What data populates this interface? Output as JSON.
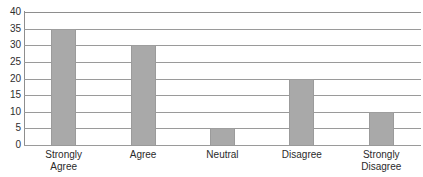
{
  "chart_data": {
    "type": "bar",
    "title": "",
    "title_visible": false,
    "title_note": "chart title is cropped off the top edge of the image and is illegible",
    "xlabel": "",
    "ylabel": "",
    "categories": [
      "Strongly Agree",
      "Agree",
      "Neutral",
      "Disagree",
      "Strongly Disagree"
    ],
    "category_lines": [
      [
        "Strongly",
        "Agree"
      ],
      [
        "Agree",
        ""
      ],
      [
        "Neutral",
        ""
      ],
      [
        "Disagree",
        ""
      ],
      [
        "Strongly",
        "Disagree"
      ]
    ],
    "values": [
      35,
      30,
      5,
      20,
      10
    ],
    "ylim": [
      0,
      40
    ],
    "ytick_step": 5,
    "yticks": [
      40,
      35,
      30,
      25,
      20,
      15,
      10,
      5,
      0
    ],
    "ytick_labels": [
      "40",
      "35",
      "30",
      "25",
      "20",
      "15",
      "10",
      "5",
      "0"
    ],
    "grid": true,
    "grid_orientation": "horizontal",
    "legend": false,
    "legend_position": "none",
    "bar_color": "#a9a9a9",
    "bar_edge_color": "#9b9b9b",
    "grid_color": "#9a9a9a",
    "axis_color": "#8e8e8e",
    "background_color": "#ffffff",
    "text_color": "#2b2b2b"
  }
}
